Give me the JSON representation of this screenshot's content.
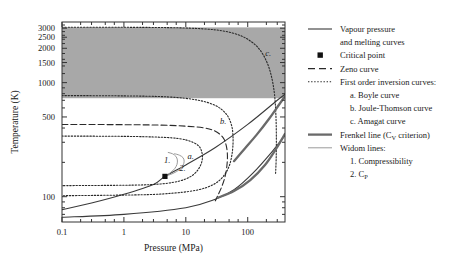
{
  "chart_data": {
    "type": "line",
    "title": "",
    "xlabel": "Pressure (MPa)",
    "ylabel": "Temperature (K)",
    "xscale": "log",
    "yscale": "log",
    "xlim": [
      0.1,
      400
    ],
    "ylim": [
      60,
      3400
    ],
    "xticks": [
      "0.1",
      "1",
      "10",
      "100"
    ],
    "xtick_values": [
      0.1,
      1,
      10,
      100
    ],
    "yticks": [
      "100",
      "500",
      "1000",
      "1500",
      "2000",
      "2500",
      "3000"
    ],
    "ytick_values": [
      100,
      500,
      1000,
      1500,
      2000,
      2500,
      3000
    ],
    "grid": false,
    "legend_position": "right-outside",
    "shaded_band": {
      "label": "supercritical shaded region",
      "upper_K": 3050,
      "lower_K": 730,
      "color": "#a8a8a8"
    },
    "critical_point": {
      "pressure_MPa": 4.6,
      "temperature_K": 150.7
    },
    "series": [
      {
        "name": "Vapour pressure and melting curves",
        "style": "solid",
        "color": "#3a3a3a",
        "points": [
          [
            0.1,
            77
          ],
          [
            0.3,
            88
          ],
          [
            1.0,
            105
          ],
          [
            3.0,
            128
          ],
          [
            4.6,
            150.7
          ],
          [
            10,
            190
          ],
          [
            30,
            270
          ],
          [
            100,
            430
          ],
          [
            300,
            700
          ],
          [
            400,
            790
          ]
        ]
      },
      {
        "name": "melting curve lower branch",
        "style": "solid",
        "color": "#3a3a3a",
        "points": [
          [
            0.1,
            66
          ],
          [
            1.0,
            70
          ],
          [
            10,
            80
          ],
          [
            30,
            95
          ],
          [
            60,
            115
          ],
          [
            120,
            160
          ],
          [
            250,
            250
          ],
          [
            400,
            345
          ]
        ]
      },
      {
        "name": "Zeno curve",
        "style": "dashed",
        "color": "#2a2a2a",
        "points": [
          [
            0.1,
            430
          ],
          [
            1.0,
            428
          ],
          [
            4.0,
            424
          ],
          [
            10,
            415
          ],
          [
            20,
            400
          ],
          [
            30,
            375
          ],
          [
            40,
            330
          ],
          [
            45,
            280
          ],
          [
            47,
            230
          ],
          [
            46,
            185
          ],
          [
            43,
            150
          ],
          [
            38,
            122
          ],
          [
            33,
            103
          ],
          [
            30,
            92
          ]
        ]
      },
      {
        "name": "a. Boyle curve",
        "style": "dotted",
        "color": "#2a2a2a",
        "points": [
          [
            0.1,
            340
          ],
          [
            1.0,
            338
          ],
          [
            4.0,
            332
          ],
          [
            8.0,
            322
          ],
          [
            12,
            305
          ],
          [
            16,
            280
          ],
          [
            18,
            250
          ],
          [
            18.5,
            215
          ],
          [
            17,
            185
          ],
          [
            14,
            160
          ],
          [
            10,
            143
          ],
          [
            6,
            133
          ],
          [
            3,
            128
          ],
          [
            1.0,
            126
          ],
          [
            0.1,
            125
          ]
        ]
      },
      {
        "name": "b. Joule-Thomson curve",
        "style": "dotted",
        "color": "#2a2a2a",
        "points": [
          [
            0.1,
            770
          ],
          [
            1.0,
            765
          ],
          [
            5.0,
            750
          ],
          [
            15,
            705
          ],
          [
            30,
            630
          ],
          [
            45,
            530
          ],
          [
            55,
            420
          ],
          [
            58,
            320
          ],
          [
            56,
            240
          ],
          [
            50,
            185
          ],
          [
            40,
            150
          ],
          [
            28,
            128
          ],
          [
            16,
            115
          ],
          [
            7,
            108
          ],
          [
            2,
            104
          ],
          [
            0.1,
            102
          ]
        ]
      },
      {
        "name": "c. Amagat curve",
        "style": "dotted",
        "color": "#2a2a2a",
        "points": [
          [
            0.1,
            3060
          ],
          [
            2,
            3050
          ],
          [
            10,
            3010
          ],
          [
            30,
            2900
          ],
          [
            60,
            2700
          ],
          [
            100,
            2400
          ],
          [
            150,
            2000
          ],
          [
            200,
            1550
          ],
          [
            240,
            1150
          ],
          [
            270,
            800
          ],
          [
            285,
            520
          ],
          [
            290,
            330
          ],
          [
            288,
            215
          ],
          [
            282,
            160
          ]
        ]
      },
      {
        "name": "1. Compressibility (Widom line)",
        "style": "solid-light",
        "color": "#9a9a9a",
        "points": [
          [
            4.6,
            150.7
          ],
          [
            5.6,
            162
          ],
          [
            6.6,
            176
          ],
          [
            7.2,
            192
          ],
          [
            7.3,
            210
          ],
          [
            6.9,
            226
          ],
          [
            6.1,
            238
          ],
          [
            5.2,
            244
          ]
        ]
      },
      {
        "name": "2. C_p (Widom line)",
        "style": "solid-light",
        "color": "#9a9a9a",
        "points": [
          [
            4.6,
            150.7
          ],
          [
            6.2,
            160
          ],
          [
            7.8,
            172
          ],
          [
            9.0,
            188
          ],
          [
            9.4,
            205
          ],
          [
            9.0,
            220
          ],
          [
            7.9,
            231
          ],
          [
            6.6,
            238
          ]
        ]
      },
      {
        "name": "Frenkel line (Cv criterion) upper",
        "style": "solid-thick",
        "color": "#6a6a6a",
        "points": [
          [
            60,
            205
          ],
          [
            90,
            265
          ],
          [
            140,
            350
          ],
          [
            220,
            480
          ],
          [
            320,
            640
          ],
          [
            400,
            760
          ]
        ]
      },
      {
        "name": "Frenkel line (Cv criterion) lower",
        "style": "solid-thick",
        "color": "#6a6a6a",
        "points": [
          [
            33,
            98
          ],
          [
            60,
            112
          ],
          [
            110,
            140
          ],
          [
            190,
            190
          ],
          [
            290,
            265
          ],
          [
            400,
            355
          ]
        ]
      }
    ],
    "annotations": [
      {
        "text": "1.",
        "pressure_MPa": 5.0,
        "temperature_K": 196
      },
      {
        "text": "2.",
        "pressure_MPa": 8.8,
        "temperature_K": 168
      },
      {
        "text": "a.",
        "pressure_MPa": 12.0,
        "temperature_K": 215
      },
      {
        "text": "b.",
        "pressure_MPa": 40.0,
        "temperature_K": 430
      },
      {
        "text": "c.",
        "pressure_MPa": 215.0,
        "temperature_K": 1700
      }
    ]
  },
  "legend": {
    "items": [
      {
        "marker": "line-solid",
        "label": "Vapour pressure"
      },
      {
        "marker": "none",
        "label": "and melting curves"
      },
      {
        "marker": "square",
        "label": "Critical point"
      },
      {
        "marker": "line-dashed",
        "label": "Zeno curve"
      },
      {
        "marker": "line-dotted",
        "label": "First order inversion curves:"
      },
      {
        "marker": "none",
        "label": "a. Boyle curve"
      },
      {
        "marker": "none",
        "label": "b. Joule-Thomson curve"
      },
      {
        "marker": "none",
        "label": "c. Amagat curve"
      },
      {
        "marker": "line-thick",
        "label": "Frenkel line (C",
        "sub": "V",
        "label_tail": " criterion)"
      },
      {
        "marker": "line-light",
        "label": "Widom lines:"
      },
      {
        "marker": "none",
        "label": "1. Compressibility"
      },
      {
        "marker": "none",
        "label": "2. C",
        "sub2": "P"
      }
    ]
  }
}
